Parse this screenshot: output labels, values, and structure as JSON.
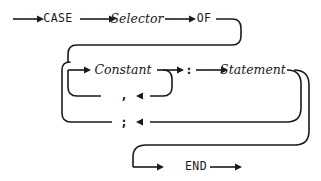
{
  "diagram": {
    "kind": "railroad-syntax-diagram",
    "stroke_color": "#1a1a1a",
    "background_color": "#ffffff",
    "nodes": [
      {
        "id": "case",
        "text": "CASE",
        "style": "keyword",
        "x": 58,
        "y": 19
      },
      {
        "id": "selector",
        "text": "Selector",
        "style": "nonterminal",
        "x": 137,
        "y": 19
      },
      {
        "id": "of",
        "text": "OF",
        "style": "keyword",
        "x": 204,
        "y": 19
      },
      {
        "id": "constant",
        "text": "Constant",
        "style": "nonterminal",
        "x": 123,
        "y": 70
      },
      {
        "id": "colon",
        "text": ":",
        "style": "punct",
        "x": 189,
        "y": 70
      },
      {
        "id": "statement",
        "text": "Statement",
        "style": "nonterminal",
        "x": 253,
        "y": 70
      },
      {
        "id": "comma",
        "text": ",",
        "style": "punct",
        "x": 124,
        "y": 95
      },
      {
        "id": "semicolon",
        "text": ";",
        "style": "punct",
        "x": 124,
        "y": 122
      },
      {
        "id": "end",
        "text": "END",
        "style": "keyword",
        "x": 196,
        "y": 167
      }
    ],
    "rails": [
      {
        "id": "entry-line",
        "d": "M 13 19 L 38 19"
      },
      {
        "id": "case-to-selector",
        "d": "M 80 19 L 110 19"
      },
      {
        "id": "selector-to-of",
        "d": "M 165 19 L 190 19"
      },
      {
        "id": "of-to-right-turn",
        "d": "M 216 19 L 232 19 Q 241 19 241 28 L 241 36 Q 241 45 232 45 L 77 45 Q 68 45 68 54 L 68 62"
      },
      {
        "id": "left-bus-down",
        "d": "M 68 70 L 68 87 Q 68 96 77 96 L 101 96"
      },
      {
        "id": "left-bus-lower",
        "d": "M 62 70 L 62 113 Q 62 122 71 122 L 112 122"
      },
      {
        "id": "left-bus-join",
        "d": "M 62 70 Q 62 62 70 62 L 68 62"
      },
      {
        "id": "constant-in",
        "d": "M 68 70 L 85 70"
      },
      {
        "id": "constant-to-colon",
        "d": "M 157 70 L 178 70"
      },
      {
        "id": "comma-loop-down",
        "d": "M 163 70 Q 172 70 172 79 L 172 87 Q 172 96 163 96 L 150 96"
      },
      {
        "id": "colon-to-statement",
        "d": "M 196 70 L 222 70"
      },
      {
        "id": "statement-out",
        "d": "M 287 70 Q 301 70 301 84 L 301 108 Q 301 122 287 122 L 150 122"
      },
      {
        "id": "statement-to-end-rail",
        "d": "M 294 70 Q 309 70 309 85 L 309 131 Q 309 145 295 145 L 146 145 Q 133 145 133 157 L 133 167"
      },
      {
        "id": "end-in",
        "d": "M 133 167 L 158 167"
      },
      {
        "id": "end-out",
        "d": "M 210 167 L 236 167"
      }
    ],
    "arrowheads": [
      {
        "id": "entry-arrow",
        "x": 44,
        "y": 19,
        "dir": "right"
      },
      {
        "id": "case-arrow",
        "x": 116,
        "y": 19,
        "dir": "right"
      },
      {
        "id": "selector-arrow",
        "x": 196,
        "y": 19,
        "dir": "right"
      },
      {
        "id": "constant-arrow",
        "x": 91,
        "y": 70,
        "dir": "right"
      },
      {
        "id": "colon-arrow",
        "x": 184,
        "y": 70,
        "dir": "right"
      },
      {
        "id": "statement-arrow",
        "x": 228,
        "y": 70,
        "dir": "right"
      },
      {
        "id": "comma-return-arrow",
        "x": 136,
        "y": 96,
        "dir": "left"
      },
      {
        "id": "semicolon-return-arrow",
        "x": 136,
        "y": 122,
        "dir": "left"
      },
      {
        "id": "end-arrow",
        "x": 164,
        "y": 167,
        "dir": "right"
      },
      {
        "id": "exit-arrow",
        "x": 242,
        "y": 167,
        "dir": "right"
      }
    ]
  }
}
